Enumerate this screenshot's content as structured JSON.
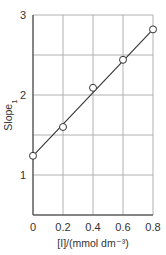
{
  "chart_data": {
    "type": "line",
    "title": "",
    "xlabel": "[I]/(mmol dm⁻³)",
    "ylabel": "Slope",
    "ylabel_subscript": "1",
    "x_ticks": [
      "0",
      "0.2",
      "0.4",
      "0.6",
      "0.8"
    ],
    "y_ticks": [
      "1",
      "2",
      "3"
    ],
    "xlim": [
      0,
      0.8
    ],
    "ylim": [
      0.5,
      3
    ],
    "grid": true,
    "x_grid": [
      0,
      0.2,
      0.4,
      0.6,
      0.8
    ],
    "y_grid": [
      0.5,
      1,
      1.5,
      2,
      2.5,
      3
    ],
    "series": [
      {
        "name": "data",
        "marker": "open-circle",
        "x": [
          0,
          0.2,
          0.4,
          0.6,
          0.8
        ],
        "y": [
          1.24,
          1.6,
          2.09,
          2.44,
          2.82
        ]
      }
    ],
    "fit_line": {
      "x": [
        0,
        0.8
      ],
      "y": [
        1.24,
        2.82
      ]
    },
    "colors": {
      "grid": "#b0b0b0",
      "axis": "#333333",
      "line": "#333333",
      "marker_fill": "#ffffff"
    }
  }
}
